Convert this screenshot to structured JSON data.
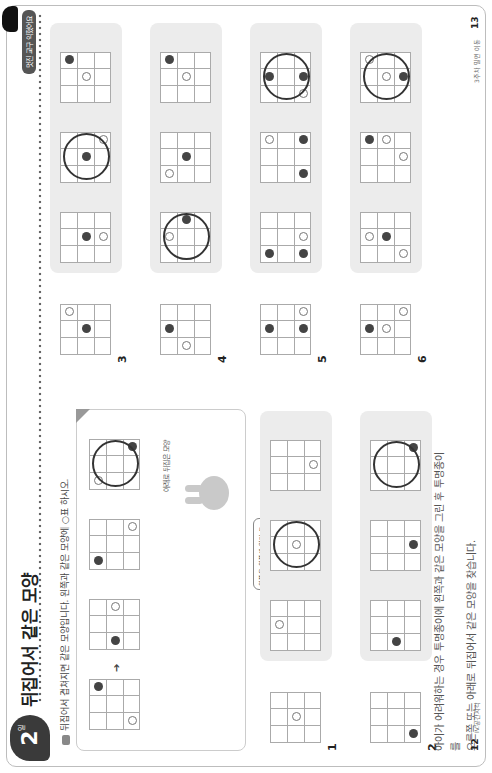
{
  "header": {
    "lesson_number": "2",
    "lesson_suffix": "일",
    "title": "뒤집어서 같은 모양",
    "tag": "멋진 교구 익혔어요",
    "instruction": "뒤집어서 겹쳐지면 같은 모양입니다. 왼쪽과 같은 모양에 ○표 하시오."
  },
  "example": {
    "arrow": "➔",
    "caption": "아래로 뒤집은 모양",
    "bubble_text": "왼쪽을 위쪽에 있던 도형이 아래쪽으로 가고, 아래쪽에 있던 도형은 위쪽으로 가요.",
    "grids": [
      {
        "dots": [
          {
            "r": 2,
            "c": 0,
            "t": "white"
          },
          {
            "r": 0,
            "c": 2,
            "t": "black"
          }
        ],
        "ring": false
      },
      {
        "dots": [
          {
            "r": 1,
            "c": 0,
            "t": "black"
          },
          {
            "r": 1,
            "c": 2,
            "t": "white"
          }
        ],
        "ring": false
      },
      {
        "dots": [
          {
            "r": 0,
            "c": 0,
            "t": "black"
          },
          {
            "r": 2,
            "c": 2,
            "t": "white"
          }
        ],
        "ring": false
      },
      {
        "dots": [
          {
            "r": 0,
            "c": 0,
            "t": "white"
          },
          {
            "r": 2,
            "c": 2,
            "t": "black"
          }
        ],
        "ring": true
      }
    ]
  },
  "problems": [
    {
      "label": "1",
      "given": {
        "dots": [
          {
            "r": 1,
            "c": 1,
            "t": "white"
          }
        ]
      },
      "options": [
        {
          "dots": [
            {
              "r": 0,
              "c": 1,
              "t": "white"
            }
          ],
          "ring": false
        },
        {
          "dots": [
            {
              "r": 1,
              "c": 1,
              "t": "white"
            }
          ],
          "ring": true
        },
        {
          "dots": [
            {
              "r": 2,
              "c": 1,
              "t": "white"
            }
          ],
          "ring": false
        }
      ]
    },
    {
      "label": "2",
      "given": {
        "dots": [
          {
            "r": 2,
            "c": 0,
            "t": "black"
          }
        ]
      },
      "options": [
        {
          "dots": [
            {
              "r": 1,
              "c": 0,
              "t": "black"
            }
          ],
          "ring": false
        },
        {
          "dots": [
            {
              "r": 2,
              "c": 1,
              "t": "black"
            }
          ],
          "ring": false
        },
        {
          "dots": [
            {
              "r": 2,
              "c": 2,
              "t": "black"
            }
          ],
          "ring": true
        }
      ]
    },
    {
      "label": "3",
      "given": {
        "dots": [
          {
            "r": 1,
            "c": 1,
            "t": "black"
          },
          {
            "r": 0,
            "c": 2,
            "t": "white"
          }
        ]
      },
      "options": [
        {
          "dots": [
            {
              "r": 1,
              "c": 1,
              "t": "black"
            },
            {
              "r": 2,
              "c": 1,
              "t": "white"
            }
          ],
          "ring": false
        },
        {
          "dots": [
            {
              "r": 1,
              "c": 1,
              "t": "black"
            },
            {
              "r": 2,
              "c": 2,
              "t": "white"
            }
          ],
          "ring": true
        },
        {
          "dots": [
            {
              "r": 1,
              "c": 1,
              "t": "white"
            },
            {
              "r": 0,
              "c": 2,
              "t": "black"
            }
          ],
          "ring": false
        }
      ]
    },
    {
      "label": "4",
      "given": {
        "dots": [
          {
            "r": 0,
            "c": 1,
            "t": "black"
          },
          {
            "r": 1,
            "c": 0,
            "t": "white"
          }
        ]
      },
      "options": [
        {
          "dots": [
            {
              "r": 0,
              "c": 1,
              "t": "white"
            },
            {
              "r": 1,
              "c": 2,
              "t": "black"
            }
          ],
          "ring": true
        },
        {
          "dots": [
            {
              "r": 1,
              "c": 1,
              "t": "black"
            },
            {
              "r": 0,
              "c": 0,
              "t": "white"
            }
          ],
          "ring": false
        },
        {
          "dots": [
            {
              "r": 1,
              "c": 1,
              "t": "white"
            },
            {
              "r": 0,
              "c": 2,
              "t": "black"
            }
          ],
          "ring": false
        }
      ]
    },
    {
      "label": "5",
      "given": {
        "dots": [
          {
            "r": 0,
            "c": 1,
            "t": "black"
          },
          {
            "r": 2,
            "c": 1,
            "t": "black"
          },
          {
            "r": 2,
            "c": 2,
            "t": "white"
          }
        ]
      },
      "options": [
        {
          "dots": [
            {
              "r": 0,
              "c": 0,
              "t": "black"
            },
            {
              "r": 2,
              "c": 0,
              "t": "black"
            },
            {
              "r": 2,
              "c": 1,
              "t": "white"
            }
          ],
          "ring": false
        },
        {
          "dots": [
            {
              "r": 2,
              "c": 0,
              "t": "black"
            },
            {
              "r": 2,
              "c": 2,
              "t": "black"
            },
            {
              "r": 0,
              "c": 2,
              "t": "white"
            }
          ],
          "ring": false
        },
        {
          "dots": [
            {
              "r": 0,
              "c": 1,
              "t": "black"
            },
            {
              "r": 2,
              "c": 1,
              "t": "black"
            },
            {
              "r": 2,
              "c": 0,
              "t": "white"
            }
          ],
          "ring": true
        }
      ]
    },
    {
      "label": "6",
      "given": {
        "dots": [
          {
            "r": 0,
            "c": 1,
            "t": "black"
          },
          {
            "r": 1,
            "c": 1,
            "t": "white"
          },
          {
            "r": 2,
            "c": 2,
            "t": "white"
          }
        ]
      },
      "options": [
        {
          "dots": [
            {
              "r": 0,
              "c": 1,
              "t": "white"
            },
            {
              "r": 1,
              "c": 1,
              "t": "black"
            },
            {
              "r": 2,
              "c": 0,
              "t": "white"
            }
          ],
          "ring": false
        },
        {
          "dots": [
            {
              "r": 0,
              "c": 2,
              "t": "black"
            },
            {
              "r": 1,
              "c": 2,
              "t": "white"
            },
            {
              "r": 2,
              "c": 1,
              "t": "white"
            }
          ],
          "ring": false
        },
        {
          "dots": [
            {
              "r": 2,
              "c": 1,
              "t": "black"
            },
            {
              "r": 1,
              "c": 1,
              "t": "white"
            },
            {
              "r": 0,
              "c": 2,
              "t": "white"
            }
          ],
          "ring": true
        }
      ]
    }
  ],
  "footer": {
    "note_line1": "아이가 어려워하는 경우 투명종이에 왼쪽과 같은 모양을 그린 후 투명종이를",
    "note_line2": "오른쪽 또는 아래로 뒤집어서 같은 모양을 찾습니다.",
    "left_page_number": "12",
    "left_section": "IV.공간지각",
    "right_page_number": "13",
    "right_section": "3주차 밀면 이동"
  }
}
